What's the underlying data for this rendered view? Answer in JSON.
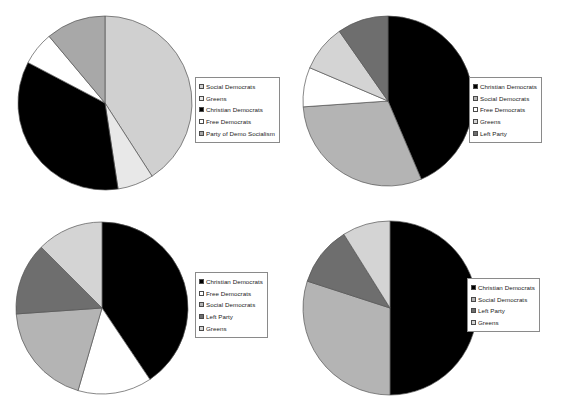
{
  "figure": {
    "type": "pie-chart-grid",
    "panels": 4,
    "background": "#ffffff"
  },
  "palette": {
    "black": "#000000",
    "white": "#ffffff",
    "light_gray": "#d0d0d0",
    "medium_gray": "#a8a8a8",
    "dark_gray": "#6e6e6e",
    "legend_border": "#8a8a8a",
    "slice_outline": "#555555"
  },
  "chart_data": [
    {
      "id": "chart-top-left",
      "type": "pie",
      "title": "",
      "legend_position": "right",
      "start_angle_deg": 0,
      "direction": "clockwise",
      "categories": [
        "Social Democrats",
        "Greens",
        "Christian Democrats",
        "Free Democrats",
        "Party of Demo Socialism"
      ],
      "values": [
        40.9,
        6.7,
        35.1,
        6.2,
        11.1
      ],
      "colors": [
        "#d0d0d0",
        "#e8e8e8",
        "#000000",
        "#ffffff",
        "#a8a8a8"
      ],
      "legend": [
        {
          "label": "Social Democrats",
          "color": "#d0d0d0"
        },
        {
          "label": "Greens",
          "color": "#e8e8e8"
        },
        {
          "label": "Christian Democrats",
          "color": "#000000"
        },
        {
          "label": "Free Democrats",
          "color": "#ffffff"
        },
        {
          "label": "Party of Demo Socialism",
          "color": "#a8a8a8"
        }
      ]
    },
    {
      "id": "chart-top-right",
      "type": "pie",
      "title": "",
      "legend_position": "right",
      "start_angle_deg": 0,
      "direction": "clockwise",
      "categories": [
        "Christian Democrats",
        "Social Democrats",
        "Free Democrats",
        "Greens",
        "Left Party"
      ],
      "values": [
        43.6,
        30.3,
        7.5,
        8.9,
        9.7
      ],
      "colors": [
        "#000000",
        "#b4b4b4",
        "#ffffff",
        "#d4d4d4",
        "#6e6e6e"
      ],
      "legend": [
        {
          "label": "Christian Democrats",
          "color": "#000000"
        },
        {
          "label": "Social Democrats",
          "color": "#b4b4b4"
        },
        {
          "label": "Free Democrats",
          "color": "#ffffff"
        },
        {
          "label": "Greens",
          "color": "#d4d4d4"
        },
        {
          "label": "Left Party",
          "color": "#6e6e6e"
        }
      ]
    },
    {
      "id": "chart-bottom-left",
      "type": "pie",
      "title": "",
      "legend_position": "right",
      "start_angle_deg": 0,
      "direction": "clockwise",
      "categories": [
        "Christian Democrats",
        "Free Democrats",
        "Social Democrats",
        "Left Party",
        "Greens"
      ],
      "values": [
        40.6,
        13.9,
        19.4,
        13.6,
        12.5
      ],
      "colors": [
        "#000000",
        "#ffffff",
        "#b4b4b4",
        "#6e6e6e",
        "#d4d4d4"
      ],
      "legend": [
        {
          "label": "Christian Democrats",
          "color": "#000000"
        },
        {
          "label": "Free Democrats",
          "color": "#ffffff"
        },
        {
          "label": "Social Democrats",
          "color": "#b4b4b4"
        },
        {
          "label": "Left Party",
          "color": "#6e6e6e"
        },
        {
          "label": "Greens",
          "color": "#d4d4d4"
        }
      ]
    },
    {
      "id": "chart-bottom-right",
      "type": "pie",
      "title": "",
      "legend_position": "right",
      "start_angle_deg": 0,
      "direction": "clockwise",
      "categories": [
        "Christian Democrats",
        "Social Democrats",
        "Left Party",
        "Greens"
      ],
      "values": [
        50.0,
        30.0,
        11.1,
        8.9
      ],
      "colors": [
        "#000000",
        "#b4b4b4",
        "#6e6e6e",
        "#d4d4d4"
      ],
      "legend": [
        {
          "label": "Christian Democrats",
          "color": "#000000"
        },
        {
          "label": "Social Democrats",
          "color": "#b4b4b4"
        },
        {
          "label": "Left Party",
          "color": "#6e6e6e"
        },
        {
          "label": "Greens",
          "color": "#d4d4d4"
        }
      ]
    }
  ]
}
